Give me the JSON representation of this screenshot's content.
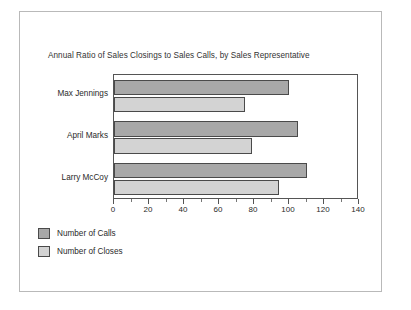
{
  "chart_data": {
    "type": "bar",
    "orientation": "horizontal",
    "title": "Annual Ratio of Sales Closings to Sales Calls, by Sales Representative",
    "xlabel": "",
    "ylabel": "",
    "categories": [
      "Max Jennings",
      "April Marks",
      "Larry McCoy"
    ],
    "series": [
      {
        "name": "Number of Calls",
        "values": [
          100,
          105,
          110
        ],
        "color": "#a8a8a8"
      },
      {
        "name": "Number of Closes",
        "values": [
          75,
          79,
          94
        ],
        "color": "#d3d3d3"
      }
    ],
    "xlim": [
      0,
      140
    ],
    "xticks": [
      0,
      20,
      40,
      60,
      80,
      100,
      120,
      140
    ],
    "xtick_labels": [
      "0",
      "20",
      "40",
      "60",
      "80",
      "100",
      "120",
      "140"
    ],
    "minor_tick_step": 10,
    "grid": false,
    "legend_position": "below-left"
  },
  "legend": {
    "items": [
      {
        "label": "Number of Calls",
        "swatch": "calls"
      },
      {
        "label": "Number of Closes",
        "swatch": "closes"
      }
    ]
  },
  "colors": {
    "calls": "#a8a8a8",
    "closes": "#d3d3d3",
    "bar_border": "#4a4a4a",
    "axis": "#555555",
    "outer_frame": "#b9b9b9",
    "background": "#ffffff"
  }
}
